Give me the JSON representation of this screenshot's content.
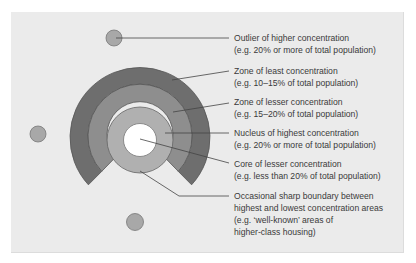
{
  "diagram": {
    "colors": {
      "background": "#ebebeb",
      "zone_least": "#6e6e6e",
      "zone_lesser": "#8e8e8e",
      "core": "#b0b0b0",
      "nucleus": "#ffffff",
      "outlier": "#a8a8a8",
      "stroke": "#555555",
      "leader": "#444444"
    },
    "labels": [
      {
        "id": "outlier",
        "title": "Outlier of higher concentration",
        "lines": [
          "(e.g. 20% or more of total population)"
        ]
      },
      {
        "id": "zone-least",
        "title": "Zone of least concentration",
        "lines": [
          "(e.g. 10–15% of total population)"
        ]
      },
      {
        "id": "zone-lesser",
        "title": "Zone of lesser concentration",
        "lines": [
          "(e.g. 15–20% of total population)"
        ]
      },
      {
        "id": "nucleus",
        "title": "Nucleus of highest concentration",
        "lines": [
          "(e.g. 20% or more of total population)"
        ]
      },
      {
        "id": "core",
        "title": "Core of lesser concentration",
        "lines": [
          "(e.g. less than 20% of total population)"
        ]
      },
      {
        "id": "boundary",
        "title": "Occasional sharp boundary between",
        "lines": [
          "highest and lowest concentration areas",
          "(e.g. ‘well-known’ areas of",
          "higher-class housing)"
        ]
      }
    ]
  }
}
